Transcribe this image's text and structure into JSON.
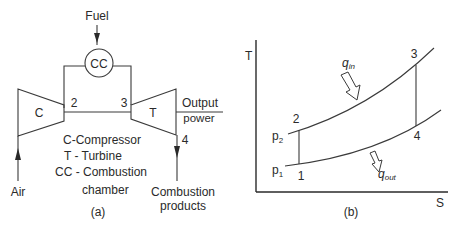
{
  "figure_a": {
    "caption": "(a)",
    "fuel_label": "Fuel",
    "combustion_chamber_label": "CC",
    "compressor_label": "C",
    "turbine_label": "T",
    "state_2": "2",
    "state_3": "3",
    "state_4": "4",
    "output_label_line1": "Output",
    "output_label_line2": "power",
    "air_label": "Air",
    "exhaust_label_line1": "Combustion",
    "exhaust_label_line2": "products",
    "legend": [
      "C-Compressor",
      "T - Turbine",
      "CC - Combustion",
      "chamber"
    ]
  },
  "figure_b": {
    "caption": "(b)",
    "y_axis_label": "T",
    "x_axis_label": "S",
    "high_pressure_label": "p",
    "high_pressure_sub": "2",
    "low_pressure_label": "p",
    "low_pressure_sub": "1",
    "point_1": "1",
    "point_2": "2",
    "point_3": "3",
    "point_4": "4",
    "heat_in_label": "q",
    "heat_in_sub": "in",
    "heat_out_label": "q",
    "heat_out_sub": "out"
  }
}
